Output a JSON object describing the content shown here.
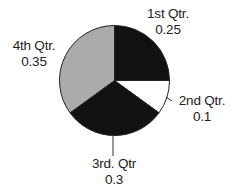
{
  "chart_data": {
    "type": "pie",
    "title": "",
    "categories": [
      "1st Qtr.",
      "2nd Qtr.",
      "3rd. Qtr",
      "4th Qtr."
    ],
    "values": [
      0.25,
      0.1,
      0.3,
      0.35
    ],
    "value_labels": [
      "0.25",
      "0.1",
      "0.3",
      "0.35"
    ],
    "colors": [
      "#111111",
      "#ffffff",
      "#111111",
      "#ababab"
    ],
    "start_angle": "12 o'clock",
    "direction": "clockwise",
    "legend": "none",
    "data_labels": "outside with category name and value"
  },
  "labels": {
    "q1": {
      "name": "1st Qtr.",
      "value": "0.25"
    },
    "q2": {
      "name": "2nd Qtr.",
      "value": "0.1"
    },
    "q3": {
      "name": "3rd. Qtr",
      "value": "0.3"
    },
    "q4": {
      "name": "4th Qtr.",
      "value": "0.35"
    }
  }
}
